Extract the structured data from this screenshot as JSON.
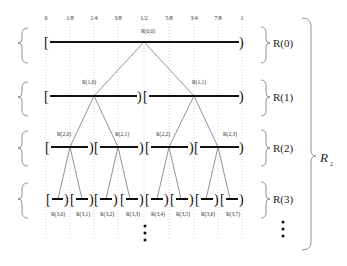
{
  "diagram": {
    "ticks": [
      "0",
      "1/8",
      "1/4",
      "3/8",
      "1/2",
      "5/8",
      "3/4",
      "7/8",
      "1"
    ],
    "levels": [
      {
        "label": "R(0)",
        "nodes": [
          "R(0,0)"
        ]
      },
      {
        "label": "R(1)",
        "nodes": [
          "R(1,0)",
          "R(1,1)"
        ]
      },
      {
        "label": "R(2)",
        "nodes": [
          "R(2,0)",
          "R(2,1)",
          "R(2,2)",
          "R(2,3)"
        ]
      },
      {
        "label": "R(3)",
        "nodes": [
          "R(3,0)",
          "R(3,1)",
          "R(3,2)",
          "R(3,3)",
          "R(3,4)",
          "R(3,5)",
          "R(3,6)",
          "R(3,7)"
        ]
      }
    ],
    "group_label": "R",
    "group_subscript": "2",
    "continuation": "⋮"
  }
}
